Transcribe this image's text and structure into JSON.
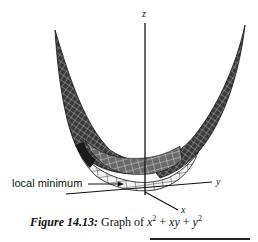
{
  "figure": {
    "label": "Figure 14.13:",
    "caption_text": "Graph of",
    "formula": {
      "term1_base": "x",
      "term1_exp": "2",
      "plus1": "+",
      "term2": "xy",
      "plus2": "+",
      "term3_base": "y",
      "term3_exp": "2"
    }
  },
  "axes": {
    "z": "z",
    "y": "y",
    "x": "x"
  },
  "annotation": {
    "text": "local minimum"
  },
  "colors": {
    "ink": "#111111",
    "mesh_dark": "#2a2a2a",
    "mesh_light": "#e6e6e6",
    "background": "#ffffff"
  }
}
